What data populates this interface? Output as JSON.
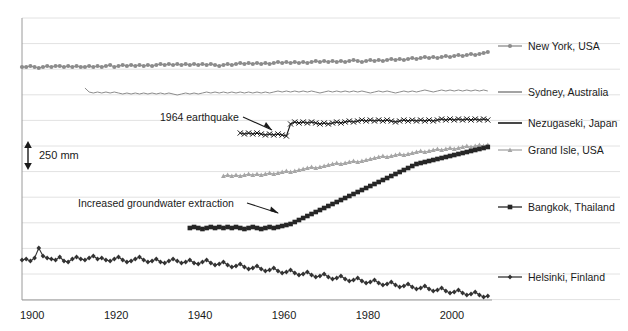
{
  "chart_data": {
    "type": "line",
    "title": "",
    "subtitle": "",
    "xlabel": "",
    "ylabel": "",
    "xlim": [
      1900,
      2012
    ],
    "xticks": [
      1900,
      1920,
      1940,
      1960,
      1980,
      2000
    ],
    "xtick_labels": [
      "1900",
      "1920",
      "1940",
      "1960",
      "1980",
      "2000"
    ],
    "grid": "horizontal",
    "gridline_count": 12,
    "legend_position": "right",
    "scale_bar": {
      "label": "250 mm",
      "value": 250,
      "unit": "mm",
      "spans_gridlines": 1
    },
    "annotations": [
      {
        "text": "1964 earthquake",
        "target_series": "Nezugaseki, Japan",
        "target_year": 1964
      },
      {
        "text": "Increased groundwater extraction",
        "target_series": "Bangkok, Thailand",
        "target_year": 1960
      }
    ],
    "series": [
      {
        "name": "New York, USA",
        "color": "#8c8c8c",
        "marker": "circle",
        "start_year": 1900,
        "end_year": 2011,
        "values": [
          67,
          67,
          66,
          67,
          68,
          67,
          66,
          67,
          66,
          66,
          67,
          66,
          67,
          66,
          67,
          67,
          66,
          67,
          66,
          67,
          66,
          65,
          67,
          66,
          65,
          66,
          65,
          66,
          65,
          66,
          65,
          66,
          65,
          64,
          65,
          64,
          65,
          64,
          65,
          64,
          65,
          64,
          65,
          64,
          65,
          64,
          65,
          66,
          65,
          64,
          65,
          64,
          63,
          64,
          63,
          64,
          63,
          64,
          63,
          64,
          63,
          62,
          63,
          62,
          63,
          62,
          63,
          62,
          63,
          62,
          61,
          62,
          61,
          62,
          61,
          62,
          61,
          62,
          61,
          60,
          61,
          62,
          61,
          60,
          61,
          60,
          61,
          60,
          59,
          60,
          59,
          60,
          59,
          58,
          59,
          58,
          57,
          58,
          57,
          58,
          57,
          56,
          57,
          56,
          55,
          56,
          55,
          54,
          55,
          54,
          53,
          52
        ]
      },
      {
        "name": "Sydney, Australia",
        "color": "#8c8c8c",
        "marker": "none",
        "start_year": 1915,
        "end_year": 2011,
        "values": [
          88,
          92,
          93,
          92,
          93,
          92,
          93,
          92,
          93,
          94,
          93,
          94,
          93,
          94,
          93,
          94,
          93,
          94,
          93,
          94,
          93,
          94,
          95,
          94,
          93,
          94,
          93,
          94,
          93,
          92,
          93,
          92,
          93,
          92,
          93,
          92,
          93,
          92,
          93,
          92,
          93,
          92,
          93,
          92,
          93,
          92,
          91,
          92,
          91,
          92,
          91,
          92,
          91,
          92,
          91,
          92,
          93,
          92,
          91,
          92,
          91,
          92,
          91,
          92,
          91,
          92,
          91,
          92,
          93,
          92,
          91,
          92,
          91,
          92,
          93,
          92,
          91,
          92,
          91,
          92,
          91,
          90,
          91,
          92,
          91,
          90,
          91,
          90,
          91,
          90,
          91,
          90,
          91,
          90,
          91,
          90,
          91
        ]
      },
      {
        "name": "Nezugaseki, Japan",
        "color": "#1a1a1a",
        "marker": "cross",
        "start_year": 1952,
        "end_year": 2011,
        "values": [
          133,
          134,
          133,
          134,
          133,
          134,
          135,
          134,
          135,
          134,
          135,
          136,
          124,
          122,
          123,
          122,
          123,
          122,
          123,
          124,
          123,
          124,
          123,
          122,
          123,
          122,
          121,
          122,
          121,
          120,
          121,
          120,
          121,
          120,
          121,
          120,
          121,
          122,
          121,
          120,
          121,
          120,
          121,
          120,
          121,
          120,
          121,
          120,
          119,
          120,
          119,
          120,
          119,
          120,
          119,
          120,
          119,
          120,
          119,
          120
        ]
      },
      {
        "name": "Grand Isle, USA",
        "color": "#a6a6a6",
        "marker": "triangle",
        "start_year": 1948,
        "end_year": 2011,
        "values": [
          176,
          175,
          176,
          175,
          176,
          175,
          174,
          175,
          174,
          175,
          174,
          173,
          174,
          173,
          172,
          171,
          172,
          171,
          170,
          169,
          168,
          167,
          168,
          167,
          166,
          165,
          164,
          163,
          164,
          163,
          162,
          161,
          162,
          161,
          160,
          159,
          158,
          157,
          156,
          157,
          156,
          155,
          154,
          155,
          154,
          153,
          152,
          151,
          152,
          151,
          150,
          149,
          150,
          149,
          148,
          149,
          148,
          147,
          146,
          147,
          146,
          145,
          146,
          145
        ]
      },
      {
        "name": "Bangkok, Thailand",
        "color": "#262626",
        "marker": "square",
        "start_year": 1940,
        "end_year": 2011,
        "values": [
          228,
          227,
          228,
          229,
          228,
          227,
          228,
          227,
          228,
          227,
          228,
          227,
          228,
          229,
          228,
          227,
          228,
          229,
          228,
          227,
          228,
          227,
          226,
          225,
          224,
          222,
          220,
          218,
          216,
          214,
          212,
          210,
          208,
          206,
          204,
          202,
          200,
          198,
          196,
          194,
          192,
          190,
          188,
          186,
          184,
          182,
          180,
          178,
          176,
          174,
          172,
          170,
          168,
          166,
          164,
          163,
          162,
          161,
          160,
          159,
          158,
          157,
          156,
          155,
          154,
          153,
          152,
          151,
          150,
          149,
          148,
          147
        ]
      },
      {
        "name": "Helsinki, Finland",
        "color": "#333333",
        "marker": "diamond",
        "start_year": 1900,
        "end_year": 2011,
        "values": [
          260,
          259,
          261,
          258,
          248,
          256,
          258,
          259,
          260,
          257,
          261,
          262,
          259,
          257,
          259,
          260,
          258,
          256,
          259,
          258,
          260,
          261,
          259,
          257,
          260,
          262,
          261,
          259,
          257,
          260,
          262,
          261,
          259,
          262,
          263,
          261,
          259,
          261,
          263,
          262,
          260,
          263,
          264,
          262,
          260,
          263,
          265,
          264,
          262,
          265,
          267,
          266,
          264,
          267,
          269,
          268,
          266,
          269,
          271,
          270,
          268,
          271,
          273,
          272,
          270,
          273,
          275,
          274,
          272,
          275,
          277,
          276,
          274,
          277,
          279,
          278,
          276,
          279,
          281,
          280,
          278,
          281,
          283,
          282,
          280,
          283,
          285,
          284,
          282,
          285,
          287,
          286,
          284,
          287,
          289,
          288,
          286,
          289,
          291,
          290,
          288,
          291,
          293,
          292,
          290,
          293,
          295,
          294,
          292,
          295,
          297,
          296
        ]
      }
    ]
  },
  "legend": {
    "items": [
      {
        "label": "New York, USA",
        "marker": "circle",
        "color": "#8c8c8c",
        "top": 40
      },
      {
        "label": "Sydney, Australia",
        "marker": "none",
        "color": "#8c8c8c",
        "top": 86
      },
      {
        "label": "Nezugaseki, Japan",
        "marker": "line",
        "color": "#1a1a1a",
        "top": 117
      },
      {
        "label": "Grand Isle, USA",
        "marker": "triangle",
        "color": "#a6a6a6",
        "top": 144
      },
      {
        "label": "Bangkok, Thailand",
        "marker": "square",
        "color": "#262626",
        "top": 201
      },
      {
        "label": "Helsinki, Finland",
        "marker": "diamond",
        "color": "#333333",
        "top": 271
      }
    ]
  },
  "annotations": {
    "earthquake": "1964 earthquake",
    "groundwater": "Increased groundwater extraction"
  },
  "scalebar": {
    "label": "250 mm"
  },
  "axis": {
    "ticks": [
      "1900",
      "1920",
      "1940",
      "1960",
      "1980",
      "2000"
    ]
  }
}
